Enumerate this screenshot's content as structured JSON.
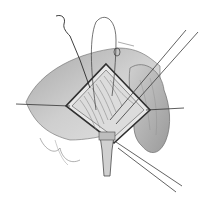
{
  "image": {
    "kind": "surgical-illustration",
    "style": "grayscale pencil line drawing",
    "width": 208,
    "height": 203,
    "colors": {
      "background": "#ffffff",
      "skin_light": "#d9d9d9",
      "skin_mid": "#b5b5b5",
      "skin_dark": "#8a8a8a",
      "line": "#3a3a3a",
      "field": "#e6e6e6"
    },
    "elements": [
      "draped-body-region",
      "diamond-incision-retracted",
      "exposed-tissue-field",
      "suture-loop-top",
      "curved-needle-top-left",
      "retraction-sutures-left-right",
      "long-instrument-shafts-diagonal",
      "tube-lower-center",
      "tissue-mass-right"
    ]
  }
}
